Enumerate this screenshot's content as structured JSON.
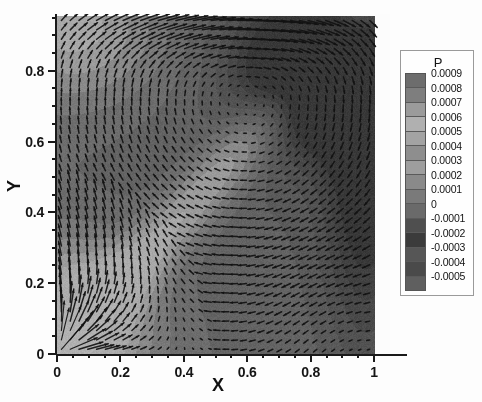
{
  "figure": {
    "kind": "contour-vector-plot",
    "background_color": "#ffffff"
  },
  "axes": {
    "x": {
      "title": "X",
      "ticks": [
        "0",
        "0.2",
        "0.4",
        "0.6",
        "0.8",
        "1"
      ],
      "tick_values": [
        0,
        0.2,
        0.4,
        0.6,
        0.8,
        1
      ],
      "range": [
        0,
        1.05
      ]
    },
    "y": {
      "title": "Y",
      "ticks": [
        "0",
        "0.2",
        "0.4",
        "0.6",
        "0.8"
      ],
      "tick_values": [
        0,
        0.2,
        0.4,
        0.6,
        0.8
      ],
      "range": [
        0,
        0.96
      ]
    }
  },
  "legend": {
    "title": "P",
    "levels": [
      "0.0009",
      "0.0008",
      "0.0007",
      "0.0006",
      "0.0005",
      "0.0004",
      "0.0003",
      "0.0002",
      "0.0001",
      "0",
      "-0.0001",
      "-0.0002",
      "-0.0003",
      "-0.0004",
      "-0.0005"
    ],
    "level_values": [
      0.0009,
      0.0008,
      0.0007,
      0.0006,
      0.0005,
      0.0004,
      0.0003,
      0.0002,
      0.0001,
      0,
      -0.0001,
      -0.0002,
      -0.0003,
      -0.0004,
      -0.0005
    ],
    "swatch_colors": [
      "#6d6d6d",
      "#7e7e7e",
      "#9b9b9b",
      "#b0b0b0",
      "#a3a3a3",
      "#8e8e8e",
      "#9e9e9e",
      "#8a8a8a",
      "#7a7a7a",
      "#6a6a6a",
      "#4f4f4f",
      "#3b3b3b",
      "#565656",
      "#4a4a4a",
      "#5f5f5f"
    ],
    "border_color": "#9a9a9a"
  },
  "chart_data": {
    "type": "heatmap",
    "title": "",
    "xlabel": "X",
    "ylabel": "Y",
    "xlim": [
      0,
      1.05
    ],
    "ylim": [
      0,
      0.96
    ],
    "grid": false,
    "legend_position": "right",
    "colorbar_label": "P",
    "colorbar_ticks": [
      "0.0009",
      "0.0008",
      "0.0007",
      "0.0006",
      "0.0005",
      "0.0004",
      "0.0003",
      "0.0002",
      "0.0001",
      "0",
      "-0.0001",
      "-0.0002",
      "-0.0003",
      "-0.0004",
      "-0.0005"
    ],
    "colorbar_range": [
      -0.0005,
      0.0009
    ],
    "colormap": "grayscale",
    "overlay": "vector-field",
    "vector_grid": {
      "nx": 36,
      "ny": 36
    },
    "description_features": [
      "light diagonal band running from lower-left to upper-right",
      "dark low-pressure lobe in the upper-right quadrant",
      "radial fan of long vectors emanating from the lower-left corner origin"
    ]
  }
}
